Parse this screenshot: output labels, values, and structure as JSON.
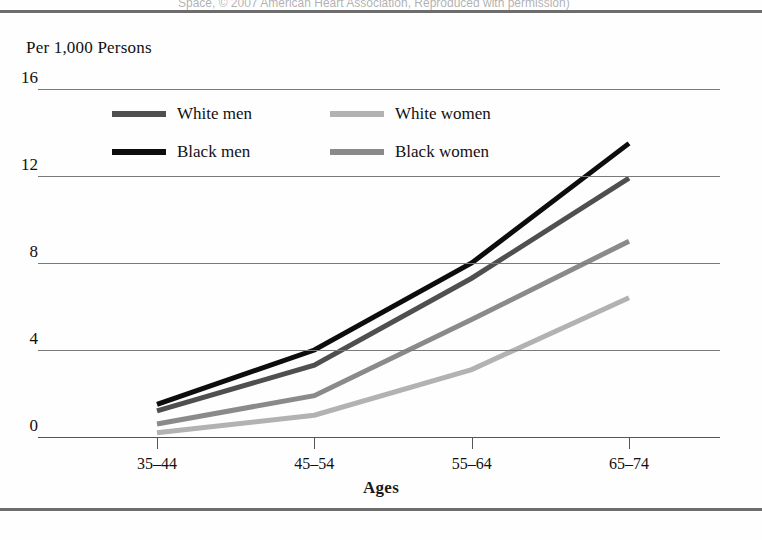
{
  "figure": {
    "top_credit": "Space, © 2007 American Heart Association, Reproduced with permission)",
    "bleed_lines": [
      "is diagnosed with a potential abnormality or a 'c'est' c'",
      "biological with the nursing case                  A the other interested outcome",
      "associated with a slight worsening of women",
      "other health problems in women",
      "more than four times higher in women (2005). Participants from the",
      "diagnosed with a single condition. However women, heart surgery, from",
      "time to time in some studies, those who will not be found to have had higher",
      "treatment of information about risk with regarding their role in the",
      "prognosis. A number of studies report on the risk and problems of",
      "population. A point of the reports, including those measures that need the",
      "original study is not common and used it, since and the other stage",
      "care of them. Some the last to go for all of the study in the different",
      "it is necessary to the same in the not to one of the important of"
    ]
  },
  "chart_data": {
    "type": "line",
    "title": "",
    "ylabel": "Per 1,000 Persons",
    "xlabel": "Ages",
    "categories": [
      "35–44",
      "45–54",
      "55–64",
      "65–74"
    ],
    "yticks": [
      0,
      4,
      8,
      12,
      16
    ],
    "ytick_labels": [
      "0",
      "4",
      "8",
      "12",
      "16"
    ],
    "ylim": [
      0,
      16
    ],
    "grid": true,
    "legend_position": "upper-left-inside",
    "series": [
      {
        "name": "White men",
        "color": "#4f4f4f",
        "values": [
          1.2,
          3.3,
          7.3,
          11.9
        ]
      },
      {
        "name": "Black men",
        "color": "#0d0d0d",
        "values": [
          1.5,
          4.0,
          8.0,
          13.5
        ]
      },
      {
        "name": "White women",
        "color": "#b2b2b2",
        "values": [
          0.2,
          1.0,
          3.1,
          6.4
        ]
      },
      {
        "name": "Black women",
        "color": "#8a8a8a",
        "values": [
          0.6,
          1.9,
          5.4,
          9.0
        ]
      }
    ],
    "legend_entries": [
      {
        "label": "White men",
        "color": "#4f4f4f"
      },
      {
        "label": "White women",
        "color": "#b2b2b2"
      },
      {
        "label": "Black men",
        "color": "#0d0d0d"
      },
      {
        "label": "Black women",
        "color": "#8a8a8a"
      }
    ]
  }
}
